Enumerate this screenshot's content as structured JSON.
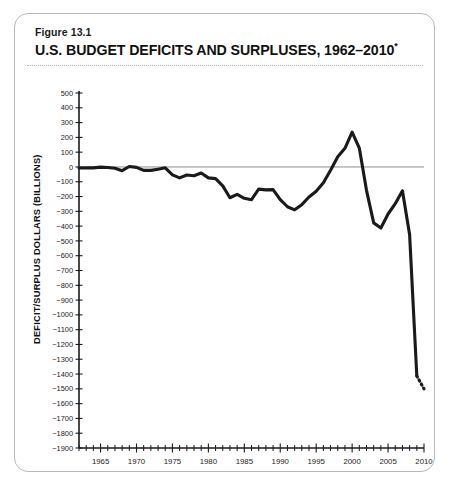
{
  "figure": {
    "label": "Figure 13.1",
    "title": "U.S. BUDGET DEFICITS AND SURPLUSES, 1962–2010",
    "title_footnote_marker": "*"
  },
  "chart_data": {
    "type": "line",
    "title": "U.S. BUDGET DEFICITS AND SURPLUSES, 1962–2010*",
    "xlabel": "",
    "ylabel": "DEFICIT/SURPLUS DOLLARS (BILLIONS)",
    "xlim": [
      1962,
      2010
    ],
    "ylim": [
      -1900,
      500
    ],
    "ytick_step": 100,
    "xtick_step": 1,
    "xtick_label_step": 5,
    "grid": false,
    "legend": false,
    "zero_reference_line": true,
    "ytick_labels": [
      "500",
      "400",
      "300",
      "200",
      "100",
      "0",
      "−100",
      "−200",
      "−300",
      "−400",
      "−500",
      "−600",
      "−700",
      "−800",
      "−900",
      "−1000",
      "−1100",
      "−1200",
      "−1300",
      "−1400",
      "−1500",
      "−1600",
      "−1700",
      "−1800",
      "−1900"
    ],
    "ytick_values": [
      500,
      400,
      300,
      200,
      100,
      0,
      -100,
      -200,
      -300,
      -400,
      -500,
      -600,
      -700,
      -800,
      -900,
      -1000,
      -1100,
      -1200,
      -1300,
      -1400,
      -1500,
      -1600,
      -1700,
      -1800,
      -1900
    ],
    "xtick_labels": [
      "1965",
      "1970",
      "1975",
      "1980",
      "1985",
      "1990",
      "1995",
      "2000",
      "2005",
      "2010"
    ],
    "xtick_values": [
      1965,
      1970,
      1975,
      1980,
      1985,
      1990,
      1995,
      2000,
      2005,
      2010
    ],
    "series": [
      {
        "name": "Budget deficit/surplus (actual)",
        "style": "solid",
        "x": [
          1962,
          1963,
          1964,
          1965,
          1966,
          1967,
          1968,
          1969,
          1970,
          1971,
          1972,
          1973,
          1974,
          1975,
          1976,
          1977,
          1978,
          1979,
          1980,
          1981,
          1982,
          1983,
          1984,
          1985,
          1986,
          1987,
          1988,
          1989,
          1990,
          1991,
          1992,
          1993,
          1994,
          1995,
          1996,
          1997,
          1998,
          1999,
          2000,
          2001,
          2002,
          2003,
          2004,
          2005,
          2006,
          2007,
          2008,
          2009
        ],
        "values": [
          -7,
          -5,
          -6,
          -1,
          -4,
          -9,
          -25,
          3,
          -3,
          -23,
          -23,
          -15,
          -6,
          -53,
          -74,
          -54,
          -59,
          -41,
          -74,
          -79,
          -128,
          -208,
          -185,
          -212,
          -221,
          -150,
          -155,
          -153,
          -221,
          -269,
          -290,
          -255,
          -203,
          -164,
          -107,
          -22,
          69,
          126,
          236,
          128,
          -158,
          -378,
          -413,
          -318,
          -248,
          -161,
          -459,
          -1413
        ]
      },
      {
        "name": "Budget deficit (projected)",
        "style": "dotted",
        "x": [
          2009,
          2010
        ],
        "values": [
          -1413,
          -1500
        ]
      }
    ]
  }
}
